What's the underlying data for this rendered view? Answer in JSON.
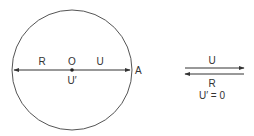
{
  "figure": {
    "circle": {
      "center_label": "O",
      "center_sublabel": "U′",
      "left_segment_label": "R",
      "right_segment_label": "U",
      "point_label": "A"
    },
    "legend": {
      "top_arrow_label": "U",
      "bottom_arrow_label": "R",
      "equation": "U′ = 0"
    },
    "colors": {
      "stroke": "#333333",
      "text": "#333333",
      "background": "#ffffff"
    }
  }
}
